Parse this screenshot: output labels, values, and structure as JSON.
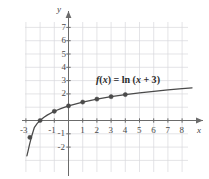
{
  "chart_data": {
    "type": "line",
    "title": "",
    "subtitle": "",
    "xlabel": "x",
    "ylabel": "y",
    "function_label": "f(x) = ln (x + 3)",
    "function_label_parts": {
      "f": "f",
      "open1": "(",
      "var1": "x",
      "close1": ")",
      "equals": " = ",
      "ln": "ln",
      "open2": " (",
      "var2": "x",
      "plus": " + 3",
      "close2": ")"
    },
    "grid": true,
    "xlim": [
      -3.6,
      9.0
    ],
    "ylim": [
      -3.0,
      7.9
    ],
    "xticks": [
      -3,
      -1,
      1,
      2,
      3,
      4,
      5,
      6,
      7,
      8
    ],
    "xtick_labels": [
      "-3",
      "-1",
      "1",
      "2",
      "3",
      "4",
      "5",
      "6",
      "7",
      "8"
    ],
    "yticks": [
      7,
      6,
      5,
      4,
      3,
      2,
      -1,
      -2
    ],
    "ytick_labels": [
      "7",
      "6",
      "5",
      "4",
      "3",
      "2",
      "-1",
      "-2"
    ],
    "series": [
      {
        "name": "f(x) = ln (x + 3)",
        "color": "#4a4a4a",
        "x": [
          -2.93,
          -2.85,
          -2.75,
          -2.6,
          -2.4,
          -2.2,
          -2.0,
          -1.75,
          -1.5,
          -1.0,
          -0.5,
          0.0,
          1.0,
          2.0,
          3.0,
          4.0,
          5.0,
          6.0,
          7.0,
          8.0,
          8.7
        ],
        "y": [
          -2.66,
          -2.3,
          -1.83,
          -1.2,
          -0.51,
          -0.22,
          0.0,
          0.223,
          0.405,
          0.693,
          0.916,
          1.099,
          1.386,
          1.609,
          1.792,
          1.946,
          2.079,
          2.197,
          2.303,
          2.398,
          2.456
        ]
      }
    ],
    "points": [
      {
        "x": -2.72,
        "y": -1.27
      },
      {
        "x": -2.0,
        "y": 0.0
      },
      {
        "x": -1.0,
        "y": 0.693
      },
      {
        "x": 0.0,
        "y": 1.099
      },
      {
        "x": 1.0,
        "y": 1.386
      },
      {
        "x": 2.0,
        "y": 1.609
      },
      {
        "x": 3.0,
        "y": 1.792
      },
      {
        "x": 4.0,
        "y": 1.946
      }
    ],
    "point_color": "#4a4a4a",
    "grid_color": "#d8d8dd",
    "axis_color": "#6b6b6b",
    "legend": "none"
  }
}
